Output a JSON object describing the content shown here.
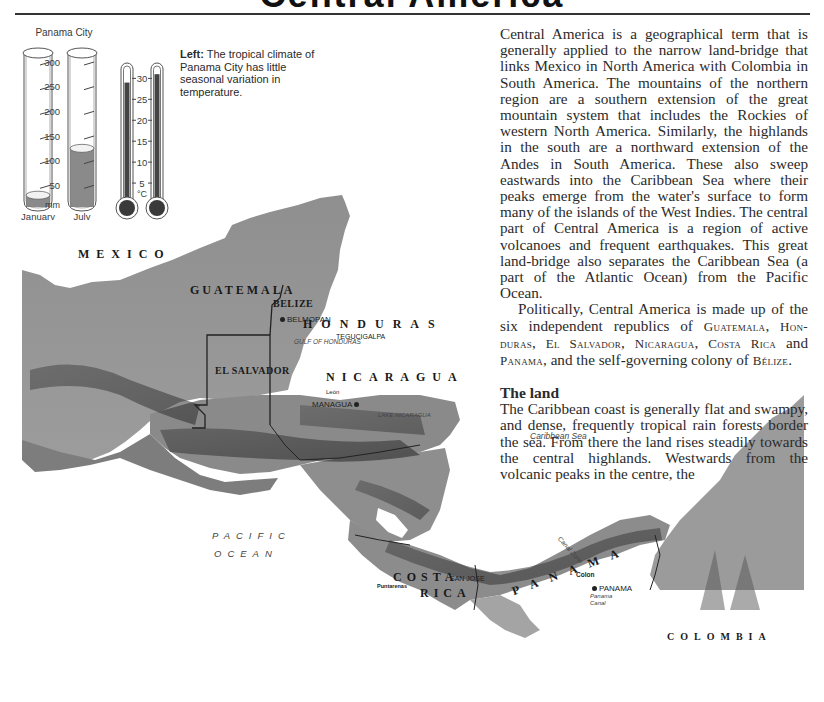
{
  "page": {
    "title": "Central America"
  },
  "infographic": {
    "city": "Panama City",
    "caption_lead": "Left:",
    "caption_text": " The tropical climate of Panama City has little seasonal variation in temperature.",
    "rainfall": {
      "unit": "mm",
      "ticks": [
        "300",
        "250",
        "200",
        "150",
        "100",
        "50"
      ],
      "max": 300,
      "columns": [
        {
          "month": "January",
          "value_mm": 30
        },
        {
          "month": "July",
          "value_mm": 125
        }
      ]
    },
    "temperature": {
      "unit": "°C",
      "ticks": [
        "30",
        "25",
        "20",
        "15",
        "10",
        "5"
      ],
      "max": 32,
      "columns": [
        {
          "month": "January",
          "value_c": 29
        },
        {
          "month": "July",
          "value_c": 31
        }
      ]
    }
  },
  "article": {
    "paragraph1": "Central America is a geographical term that is generally applied to the narrow land-bridge that links Mexico in North America with Colombia in South America. The mountains of the northern region are a southern extension of the great mountain system that includes the Rockies of western North America. Similarly, the highlands in the south are a northward extension of the Andes in South America. These also sweep eastwards into the Caribbean Sea where their peaks emerge from the water's surface to form many of the islands of the West Indies. The central part of Central America is a region of active volcanoes and frequent earthquakes. This great land-bridge also separates the Caribbean Sea (a part of the Atlantic Ocean) from the Pacific Ocean.",
    "paragraph2_intro": "Politically, Central America is made up of the six independent republics of ",
    "countries_sc": [
      "Guatemala",
      "Hon-duras",
      "El Salvador",
      "Nicaragua",
      "Costa Rica"
    ],
    "and_word": " and ",
    "panama_sc": "Panama",
    "paragraph2_mid": ", and the self-governing colony of ",
    "belize_sc": "Bélize",
    "paragraph2_end": ".",
    "heading": "The land",
    "paragraph3": "The Caribbean coast is generally flat and swampy, and dense, frequently tropical rain forests border the sea. From there the land rises steadily towards the central highlands. Westwards from the volcanic peaks in the centre, the"
  },
  "map": {
    "countries": {
      "mexico": "MEXICO",
      "guatemala": "GUATEMALA",
      "belize": "BELIZE",
      "honduras": "HONDURAS",
      "el_salvador": "EL SALVADOR",
      "nicaragua": "NICARAGUA",
      "costa_rica_1": "COSTA",
      "costa_rica_2": "RICA",
      "panama": "PANAMA",
      "colombia": "COLOMBIA"
    },
    "cities": {
      "belmopan": "BELMOPAN",
      "tegucigalpa": "TEGUCIGALPA",
      "managua": "MANAGUA",
      "leon": "León",
      "granada": "Granada",
      "san_jose": "SAN JOSE",
      "puntarenas": "Puntarenas",
      "colon": "Colon",
      "panama_city": "PANAMA",
      "guatemala_city": "Guatemala",
      "san_salvador": "San Salvador"
    },
    "water": {
      "gulf": "GULF OF HONDURAS",
      "lake": "LAKE NICARAGUA",
      "caribbean": "Caribbean Sea",
      "pacific_1": "PACIFIC",
      "pacific_2": "OCEAN",
      "canal_zone": "Canal Zone",
      "panama_canal_1": "Panama",
      "panama_canal_2": "Canal"
    }
  }
}
